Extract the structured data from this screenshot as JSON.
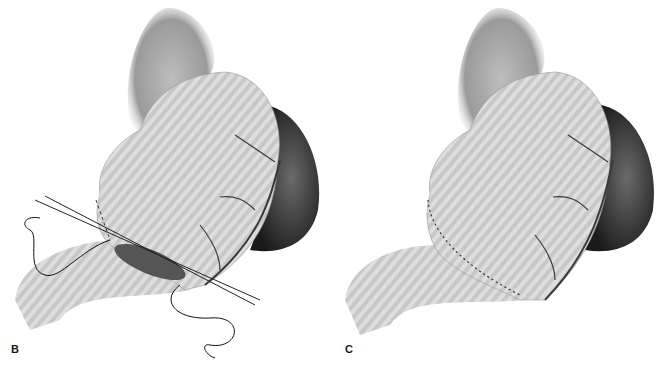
{
  "figure": {
    "panels": [
      {
        "label": "B",
        "description": "Stomach with partially completed closure; sutures and clamps across the transected duodenal/antral segment"
      },
      {
        "label": "C",
        "description": "Stomach with completed stapled closure line along the greater curvature"
      }
    ]
  },
  "colors": {
    "background": "#ffffff",
    "stomach": "#c8c8c8",
    "stomach_stripe": "#e2e2e2",
    "spleen": "#2a2a2a",
    "vessel": "#3a3a3a",
    "suture": "#111111"
  }
}
